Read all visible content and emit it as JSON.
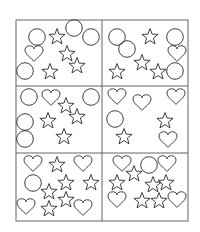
{
  "worksheet": {
    "description": "Shape counting worksheet: 3x2 grid of panels containing circles, hearts and stars",
    "colors": {
      "stroke": "#2a2a2a",
      "grid": "#555555",
      "background": "#ffffff"
    },
    "frame": {
      "x": 16,
      "y": 20,
      "width": 172,
      "height": 201
    },
    "dividers": {
      "vertical_x": 102,
      "horizontal_y": [
        86,
        153
      ]
    },
    "panels": [
      {
        "id": "top-left",
        "counts": {
          "circle": 4,
          "heart": 1,
          "star": 4
        },
        "shapes": [
          {
            "type": "circle",
            "x": 37,
            "y": 37
          },
          {
            "type": "star",
            "x": 57,
            "y": 37
          },
          {
            "type": "circle",
            "x": 74,
            "y": 28
          },
          {
            "type": "circle",
            "x": 91,
            "y": 37
          },
          {
            "type": "heart",
            "x": 34,
            "y": 53
          },
          {
            "type": "star",
            "x": 67,
            "y": 54
          },
          {
            "type": "circle",
            "x": 25,
            "y": 71
          },
          {
            "type": "star",
            "x": 50,
            "y": 72
          },
          {
            "type": "star",
            "x": 77,
            "y": 66
          }
        ]
      },
      {
        "id": "top-right",
        "counts": {
          "circle": 4,
          "heart": 1,
          "star": 4
        },
        "shapes": [
          {
            "type": "circle",
            "x": 117,
            "y": 37
          },
          {
            "type": "circle",
            "x": 127,
            "y": 49
          },
          {
            "type": "star",
            "x": 150,
            "y": 37
          },
          {
            "type": "circle",
            "x": 175,
            "y": 37
          },
          {
            "type": "heart",
            "x": 177,
            "y": 53
          },
          {
            "type": "star",
            "x": 142,
            "y": 63
          },
          {
            "type": "star",
            "x": 117,
            "y": 72
          },
          {
            "type": "star",
            "x": 158,
            "y": 72
          },
          {
            "type": "circle",
            "x": 175,
            "y": 71
          }
        ]
      },
      {
        "id": "middle-left",
        "counts": {
          "circle": 4,
          "heart": 1,
          "star": 4
        },
        "shapes": [
          {
            "type": "circle",
            "x": 29,
            "y": 97
          },
          {
            "type": "heart",
            "x": 51,
            "y": 97
          },
          {
            "type": "circle",
            "x": 91,
            "y": 97
          },
          {
            "type": "star",
            "x": 66,
            "y": 106
          },
          {
            "type": "star",
            "x": 77,
            "y": 117
          },
          {
            "type": "star",
            "x": 48,
            "y": 121
          },
          {
            "type": "circle",
            "x": 25,
            "y": 122
          },
          {
            "type": "circle",
            "x": 25,
            "y": 139
          },
          {
            "type": "star",
            "x": 64,
            "y": 137
          }
        ]
      },
      {
        "id": "middle-right",
        "counts": {
          "circle": 1,
          "heart": 4,
          "star": 2
        },
        "shapes": [
          {
            "type": "heart",
            "x": 117,
            "y": 96
          },
          {
            "type": "heart",
            "x": 142,
            "y": 102
          },
          {
            "type": "heart",
            "x": 176,
            "y": 96
          },
          {
            "type": "circle",
            "x": 115,
            "y": 119
          },
          {
            "type": "star",
            "x": 165,
            "y": 121
          },
          {
            "type": "star",
            "x": 124,
            "y": 137
          },
          {
            "type": "heart",
            "x": 168,
            "y": 139
          }
        ]
      },
      {
        "id": "bottom-left",
        "counts": {
          "circle": 1,
          "heart": 4,
          "star": 6
        },
        "shapes": [
          {
            "type": "heart",
            "x": 33,
            "y": 163
          },
          {
            "type": "star",
            "x": 57,
            "y": 165
          },
          {
            "type": "heart",
            "x": 83,
            "y": 163
          },
          {
            "type": "circle",
            "x": 33,
            "y": 183
          },
          {
            "type": "star",
            "x": 66,
            "y": 183
          },
          {
            "type": "star",
            "x": 91,
            "y": 183
          },
          {
            "type": "star",
            "x": 49,
            "y": 192
          },
          {
            "type": "star",
            "x": 66,
            "y": 200
          },
          {
            "type": "heart",
            "x": 26,
            "y": 206
          },
          {
            "type": "star",
            "x": 49,
            "y": 209
          },
          {
            "type": "heart",
            "x": 83,
            "y": 207
          }
        ]
      },
      {
        "id": "bottom-right",
        "counts": {
          "circle": 1,
          "heart": 4,
          "star": 6
        },
        "shapes": [
          {
            "type": "heart",
            "x": 122,
            "y": 163
          },
          {
            "type": "circle",
            "x": 149,
            "y": 165
          },
          {
            "type": "heart",
            "x": 167,
            "y": 163
          },
          {
            "type": "star",
            "x": 134,
            "y": 174
          },
          {
            "type": "star",
            "x": 117,
            "y": 183
          },
          {
            "type": "star",
            "x": 153,
            "y": 185
          },
          {
            "type": "star",
            "x": 166,
            "y": 183
          },
          {
            "type": "heart",
            "x": 117,
            "y": 199
          },
          {
            "type": "star",
            "x": 142,
            "y": 201
          },
          {
            "type": "star",
            "x": 159,
            "y": 201
          },
          {
            "type": "heart",
            "x": 177,
            "y": 199
          }
        ]
      }
    ]
  }
}
